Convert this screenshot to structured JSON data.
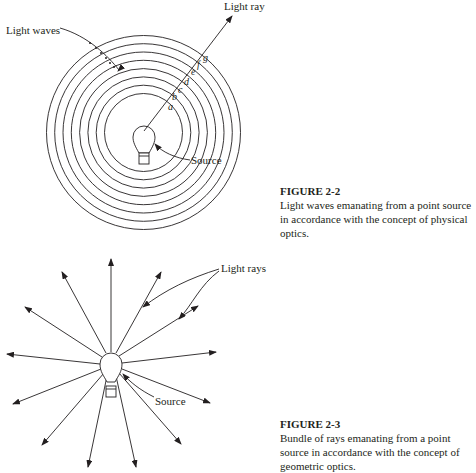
{
  "figure_2_2": {
    "title": "FIGURE 2-2",
    "caption": "Light waves emanating from a point source in accordance with the concept of physical optics.",
    "labels": {
      "light_ray": "Light ray",
      "light_waves": "Light waves",
      "source": "Source",
      "wavefront_points": [
        "a",
        "b",
        "c",
        "d",
        "e",
        "f",
        "g"
      ]
    }
  },
  "figure_2_3": {
    "title": "FIGURE 2-3",
    "caption": "Bundle of rays emanating from a point source in accordance with the concept of geometric optics.",
    "labels": {
      "light_rays": "Light rays",
      "source": "Source"
    }
  },
  "colors": {
    "ink": "#231f20",
    "background": "#ffffff"
  }
}
